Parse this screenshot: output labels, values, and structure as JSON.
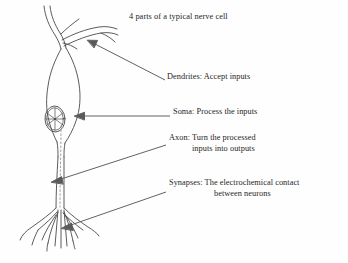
{
  "figure": {
    "title": "4 parts of a typical nerve cell",
    "subject": "neuron",
    "ink_color": "#4a4a4a",
    "text_color": "#262626",
    "background_color": "#fefefe"
  },
  "labels": [
    {
      "id": "dendrites",
      "name": "Dendrites",
      "text": "Dendrites: Accept inputs",
      "line1": "Dendrites: Accept inputs",
      "line2": "",
      "points_to": "dendrite-branches"
    },
    {
      "id": "soma",
      "name": "Soma",
      "text": "Soma: Process the inputs",
      "line1": "Soma: Process the inputs",
      "line2": "",
      "points_to": "cell-body"
    },
    {
      "id": "axon",
      "name": "Axon",
      "text": "Axon: Turn the processed inputs into outputs",
      "line1": "Axon: Turn the processed",
      "line2": "inputs into outputs",
      "points_to": "axon-shaft"
    },
    {
      "id": "synapses",
      "name": "Synapses",
      "text": "Synapses: The electrochemical contact between neurons",
      "line1": "Synapses: The electrochemical contact",
      "line2": "between neurons",
      "points_to": "axon-terminals"
    }
  ],
  "diagram_parts": [
    {
      "id": "dendrite-branches",
      "label": "dendrites"
    },
    {
      "id": "cell-body",
      "label": "soma"
    },
    {
      "id": "nucleus",
      "label": "nucleus"
    },
    {
      "id": "axon-shaft",
      "label": "axon"
    },
    {
      "id": "axon-terminals",
      "label": "synapses"
    }
  ]
}
